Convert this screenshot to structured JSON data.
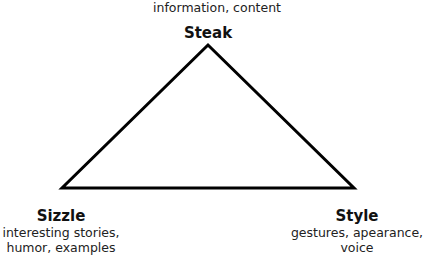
{
  "diagram": {
    "type": "triangle",
    "stroke_color": "#000000",
    "vertices": {
      "top": {
        "title": "Steak",
        "description": "information, content"
      },
      "bottom_left": {
        "title": "Sizzle",
        "description_lines": [
          "interesting stories,",
          "humor, examples"
        ]
      },
      "bottom_right": {
        "title": "Style",
        "description_lines": [
          "gestures, apearance,",
          "voice"
        ]
      }
    }
  }
}
